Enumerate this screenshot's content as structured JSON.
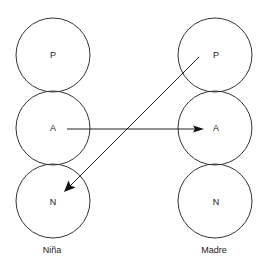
{
  "diagram": {
    "type": "transactional-analysis-ego-states",
    "columns": [
      {
        "label": "Niña",
        "nodes": [
          {
            "label": "P"
          },
          {
            "label": "A"
          },
          {
            "label": "N"
          }
        ]
      },
      {
        "label": "Madre",
        "nodes": [
          {
            "label": "P"
          },
          {
            "label": "A"
          },
          {
            "label": "N"
          }
        ]
      }
    ],
    "edges": [
      {
        "from": "Niña.A",
        "to": "Madre.A"
      },
      {
        "from": "Madre.P",
        "to": "Niña.N"
      }
    ]
  }
}
